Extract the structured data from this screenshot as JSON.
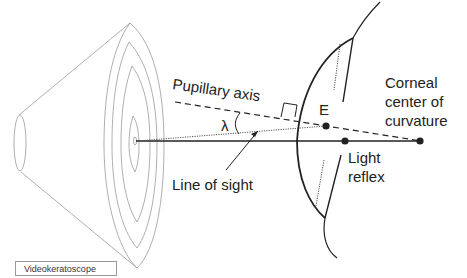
{
  "diagram": {
    "labels": {
      "pupillary_axis": "Pupillary axis",
      "lambda": "λ",
      "line_of_sight": "Line of sight",
      "point_e": "E",
      "corneal_center_line1": "Corneal",
      "corneal_center_line2": "center of",
      "corneal_center_line3": "curvature",
      "light_reflex_line1": "Light",
      "light_reflex_line2": "reflex",
      "instrument": "Videokeratoscope"
    },
    "colors": {
      "ink": "#222222",
      "thin_line": "#9a9a9a",
      "background": "#ffffff"
    }
  }
}
